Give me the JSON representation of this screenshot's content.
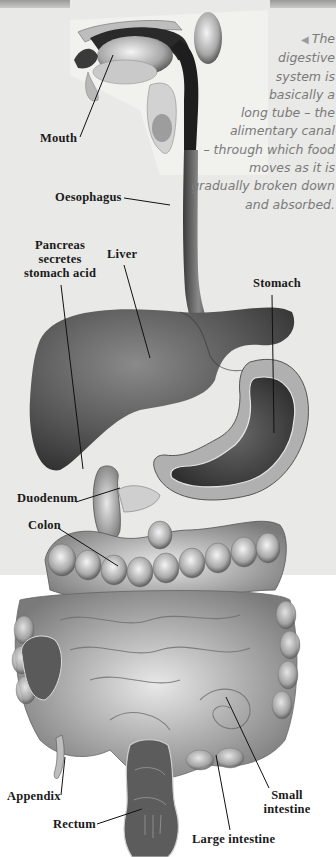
{
  "caption": {
    "arrow_icon": "◀",
    "lines": [
      "The",
      "digestive",
      "system is",
      "basically a",
      "long tube – the",
      "alimentary canal",
      "– through which food",
      "moves as it is",
      "gradually broken down",
      "and absorbed."
    ]
  },
  "labels": {
    "mouth": "Mouth",
    "oesophagus": "Oesophagus",
    "pancreas": [
      "Pancreas",
      "secretes",
      "stomach acid"
    ],
    "liver": "Liver",
    "stomach": "Stomach",
    "duodenum": "Duodenum",
    "colon": "Colon",
    "appendix": "Appendix",
    "small_intestine": [
      "Small",
      "intestine"
    ],
    "rectum": "Rectum",
    "large_intestine": "Large intestine"
  },
  "colors": {
    "background_top": "#e9e9e7",
    "background_bottom": "#ffffff",
    "label_text": "#1a1a1a",
    "caption_text": "#7a7a7a"
  }
}
